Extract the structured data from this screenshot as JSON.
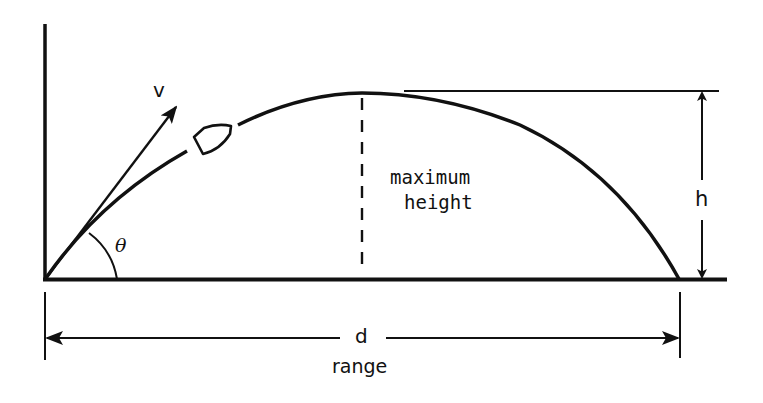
{
  "diagram": {
    "colors": {
      "background": "#ffffff",
      "ink": "#111111"
    },
    "labels": {
      "velocity": "v",
      "angle": "θ",
      "max_height_line1": "maximum",
      "max_height_line2": "height",
      "height": "h",
      "distance": "d",
      "range": "range"
    },
    "geometry": {
      "origin": [
        45,
        279
      ],
      "landing": [
        679,
        279
      ],
      "apex": [
        362,
        93
      ],
      "ground_end_x": 727,
      "vertical_axis_top_y": 24
    }
  }
}
